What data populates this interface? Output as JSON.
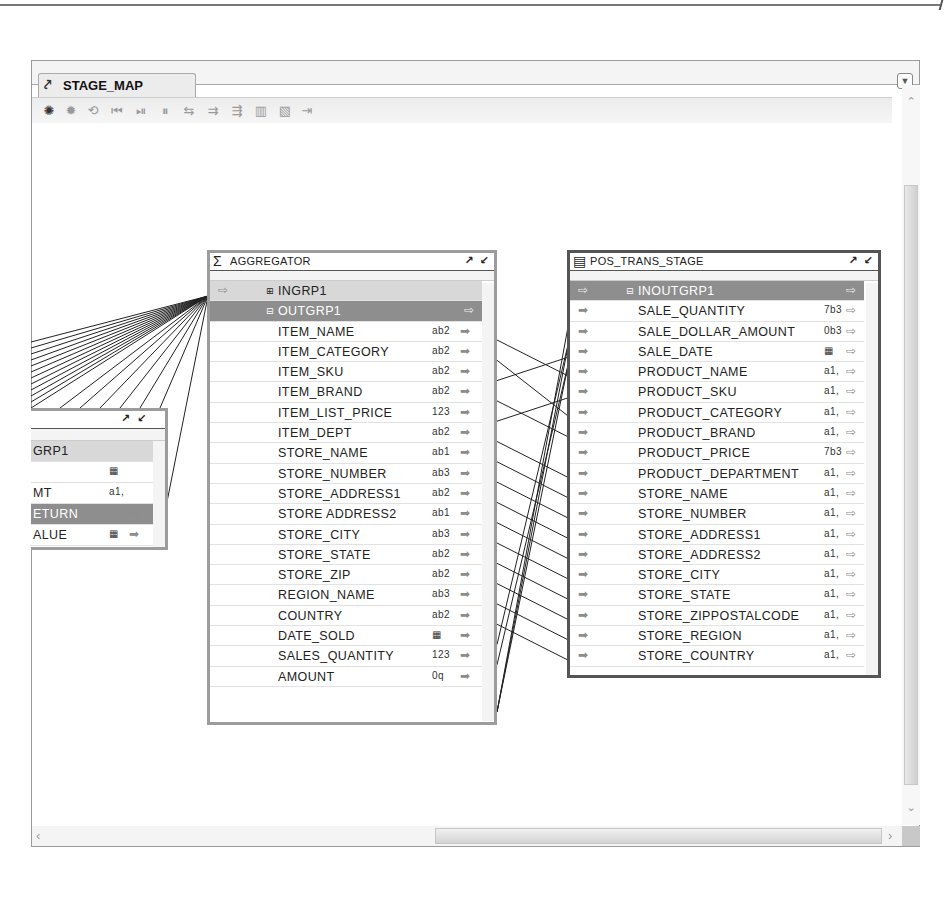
{
  "editor": {
    "tab_label": "STAGE_MAP",
    "tab_icon": "mapping-icon",
    "menu_icon": "dropdown-triangle-icon",
    "toolbar_icons": [
      "debug-start-icon",
      "debug-stop-icon",
      "debug-step-icon",
      "first-icon",
      "next-icon",
      "pause-icon",
      "map-by-name-icon",
      "map-by-position-icon",
      "auto-map-icon",
      "table-icon",
      "window-icon",
      "export-icon"
    ]
  },
  "operators": {
    "partial": {
      "rows": [
        {
          "name": "GRP1",
          "type": "group",
          "dtype": ""
        },
        {
          "name": "",
          "type": "field",
          "dtype": "date"
        },
        {
          "name": "MT",
          "type": "field",
          "dtype": "a1,"
        },
        {
          "name": "ETURN",
          "type": "group-selected",
          "dtype": ""
        },
        {
          "name": "ALUE",
          "type": "field",
          "dtype": "date"
        }
      ]
    },
    "aggregator": {
      "title": "AGGREGATOR",
      "icon": "sigma-icon",
      "groups": [
        {
          "name": "INGRP1",
          "expanded": false
        },
        {
          "name": "OUTGRP1",
          "expanded": true
        }
      ],
      "fields": [
        {
          "name": "ITEM_NAME",
          "dtype": "ab2"
        },
        {
          "name": "ITEM_CATEGORY",
          "dtype": "ab2"
        },
        {
          "name": "ITEM_SKU",
          "dtype": "ab2"
        },
        {
          "name": "ITEM_BRAND",
          "dtype": "ab2"
        },
        {
          "name": "ITEM_LIST_PRICE",
          "dtype": "123"
        },
        {
          "name": "ITEM_DEPT",
          "dtype": "ab2"
        },
        {
          "name": "STORE_NAME",
          "dtype": "ab1"
        },
        {
          "name": "STORE_NUMBER",
          "dtype": "ab3"
        },
        {
          "name": "STORE_ADDRESS1",
          "dtype": "ab2"
        },
        {
          "name": "STORE ADDRESS2",
          "dtype": "ab1"
        },
        {
          "name": "STORE_CITY",
          "dtype": "ab3"
        },
        {
          "name": "STORE_STATE",
          "dtype": "ab2"
        },
        {
          "name": "STORE_ZIP",
          "dtype": "ab2"
        },
        {
          "name": "REGION_NAME",
          "dtype": "ab3"
        },
        {
          "name": "COUNTRY",
          "dtype": "ab2"
        },
        {
          "name": "DATE_SOLD",
          "dtype": "date"
        },
        {
          "name": "SALES_QUANTITY",
          "dtype": "123"
        },
        {
          "name": "AMOUNT",
          "dtype": "0q"
        }
      ]
    },
    "pos_trans_stage": {
      "title": "POS_TRANS_STAGE",
      "icon": "table-icon",
      "group": "INOUTGRP1",
      "fields": [
        {
          "name": "SALE_QUANTITY",
          "dtype": "7b3"
        },
        {
          "name": "SALE_DOLLAR_AMOUNT",
          "dtype": "0b3"
        },
        {
          "name": "SALE_DATE",
          "dtype": "date"
        },
        {
          "name": "PRODUCT_NAME",
          "dtype": "a1,"
        },
        {
          "name": "PRODUCT_SKU",
          "dtype": "a1,"
        },
        {
          "name": "PRODUCT_CATEGORY",
          "dtype": "a1,"
        },
        {
          "name": "PRODUCT_BRAND",
          "dtype": "a1,"
        },
        {
          "name": "PRODUCT_PRICE",
          "dtype": "7b3"
        },
        {
          "name": "PRODUCT_DEPARTMENT",
          "dtype": "a1,"
        },
        {
          "name": "STORE_NAME",
          "dtype": "a1,"
        },
        {
          "name": "STORE_NUMBER",
          "dtype": "a1,"
        },
        {
          "name": "STORE_ADDRESS1",
          "dtype": "a1,"
        },
        {
          "name": "STORE_ADDRESS2",
          "dtype": "a1,"
        },
        {
          "name": "STORE_CITY",
          "dtype": "a1,"
        },
        {
          "name": "STORE_STATE",
          "dtype": "a1,"
        },
        {
          "name": "STORE_ZIPPOSTALCODE",
          "dtype": "a1,"
        },
        {
          "name": "STORE_REGION",
          "dtype": "a1,"
        },
        {
          "name": "STORE_COUNTRY",
          "dtype": "a1,"
        }
      ]
    }
  },
  "glyphs": {
    "tab_icon": "⤤",
    "menu": "▼",
    "sigma": "Σ",
    "table": "▤",
    "maximize": "↗",
    "minimize": "↙",
    "expand": "⊞",
    "collapse": "⊟",
    "in_arrow": "➡",
    "out_arrow": "⇨",
    "scroll_up": "⌃",
    "scroll_down": "⌄",
    "scroll_left": "‹",
    "scroll_right": "›",
    "date": "▦",
    "toolbar": [
      "✺",
      "✹",
      "⟲",
      "⏮",
      "⏯",
      "⏸",
      "⇆",
      "⇉",
      "⇶",
      "▥",
      "▧",
      "⇥"
    ]
  }
}
